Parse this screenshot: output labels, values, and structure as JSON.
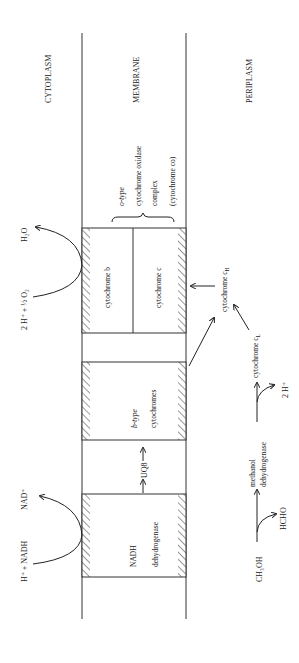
{
  "regions": {
    "cytoplasm": "CYTOPLASM",
    "membrane": "MEMBRANE",
    "periplasm": "PERIPLASM"
  },
  "oxidase_complex": {
    "line1": "o-type",
    "line2": "cytochrome oxidase",
    "line3": "complex",
    "line4": "(cytochrome co)",
    "subunit_b": "cytochrome b",
    "subunit_c": "cytochrome c"
  },
  "b_type": {
    "line1": "b-type",
    "line2": "cytochromes"
  },
  "quinone": "UQ8",
  "nadh_dh": {
    "line1": "NADH",
    "line2": "dehydrogenase"
  },
  "cytoplasm_reactions": {
    "oxygen_in": "2 H⁺ + ½ O₂",
    "water_out": "H₂O",
    "nadh_in": "H⁺ + NADH",
    "nad_out": "NAD⁺"
  },
  "periplasm": {
    "cyt_ch": "cytochrome cH",
    "cyt_cl": "cytochrome cL",
    "protons": "2 H⁺",
    "methanol": "CH₃OH",
    "formaldehyde": "HCHO",
    "enzyme_line1": "methanol",
    "enzyme_line2": "dehydrogenase"
  },
  "colors": {
    "ink": "#222222",
    "background": "#ffffff"
  }
}
